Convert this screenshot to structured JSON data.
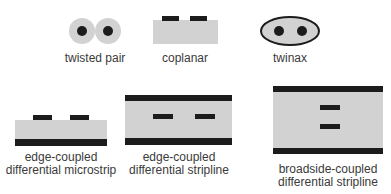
{
  "colors": {
    "dielectric": "#cfcfcf",
    "conductor": "#1c1c1c",
    "label": "#3a3a3a",
    "background": "#ffffff"
  },
  "figures": [
    {
      "id": "twisted-pair",
      "label": "twisted pair"
    },
    {
      "id": "coplanar",
      "label": "coplanar"
    },
    {
      "id": "twinax",
      "label": "twinax"
    },
    {
      "id": "edge-coupled-microstrip",
      "label_line1": "edge-coupled",
      "label_line2": "differential microstrip"
    },
    {
      "id": "edge-coupled-stripline",
      "label_line1": "edge-coupled",
      "label_line2": "differential stripline"
    },
    {
      "id": "broadside-coupled-stripline",
      "label_line1": "broadside-coupled",
      "label_line2": "differential stripline"
    }
  ]
}
